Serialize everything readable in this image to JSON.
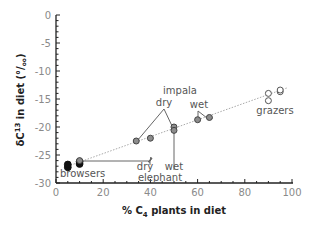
{
  "chart_data": {
    "type": "scatter",
    "title": "",
    "xlabel": "% C4 plants in diet",
    "xlabel_main": "% C",
    "xlabel_sub": "4",
    "xlabel_rest": " plants in diet",
    "ylabel": "δC13 in diet (°/oo)",
    "ylabel_main": "δC",
    "ylabel_sup": "13",
    "ylabel_rest": " in diet (°/",
    "ylabel_oo": "oo",
    "ylabel_close": ")",
    "xlim": [
      0,
      100
    ],
    "ylim": [
      -30,
      0
    ],
    "x_ticks": [
      0,
      20,
      40,
      60,
      80,
      100
    ],
    "x_tick_labels": [
      "0",
      "20",
      "40",
      "60",
      "80",
      "100"
    ],
    "y_ticks": [
      0,
      -5,
      -10,
      -15,
      -20,
      -25,
      -30
    ],
    "y_tick_labels": [
      "0",
      "-5",
      "-10",
      "-15",
      "-20",
      "-25",
      "-30"
    ],
    "grid": false,
    "legend": null,
    "series": [
      {
        "name": "browsers",
        "marker": "filled-black",
        "points": [
          [
            5,
            -27.2
          ],
          [
            5,
            -26.7
          ],
          [
            10,
            -26.6
          ],
          [
            10,
            -26.2
          ]
        ]
      },
      {
        "name": "elephant dry",
        "marker": "filled-gray",
        "points": [
          [
            10,
            -26.0
          ],
          [
            40,
            -22.0
          ]
        ]
      },
      {
        "name": "impala dry",
        "marker": "filled-gray",
        "points": [
          [
            34,
            -22.5
          ],
          [
            50,
            -20.0
          ]
        ]
      },
      {
        "name": "elephant wet",
        "marker": "filled-gray",
        "points": [
          [
            50,
            -20.6
          ]
        ]
      },
      {
        "name": "impala wet",
        "marker": "filled-gray",
        "points": [
          [
            60,
            -18.7
          ],
          [
            65,
            -18.3
          ]
        ]
      },
      {
        "name": "grazers",
        "marker": "open",
        "points": [
          [
            90,
            -15.3
          ],
          [
            90,
            -14.0
          ],
          [
            95,
            -13.7
          ],
          [
            95,
            -13.4
          ]
        ]
      }
    ],
    "trend_line": {
      "style": "dotted",
      "from": [
        5,
        -27
      ],
      "to": [
        98,
        -13
      ]
    },
    "annotations": [
      "browsers",
      "impala",
      "dry",
      "wet",
      "dry",
      "wet",
      "elephant",
      "grazers"
    ]
  },
  "labels": {
    "browsers": "browsers",
    "impala": "impala",
    "impala_dry": "dry",
    "impala_wet": "wet",
    "elephant_dry": "dry",
    "elephant_wet": "wet",
    "elephant": "elephant",
    "grazers": "grazers"
  }
}
